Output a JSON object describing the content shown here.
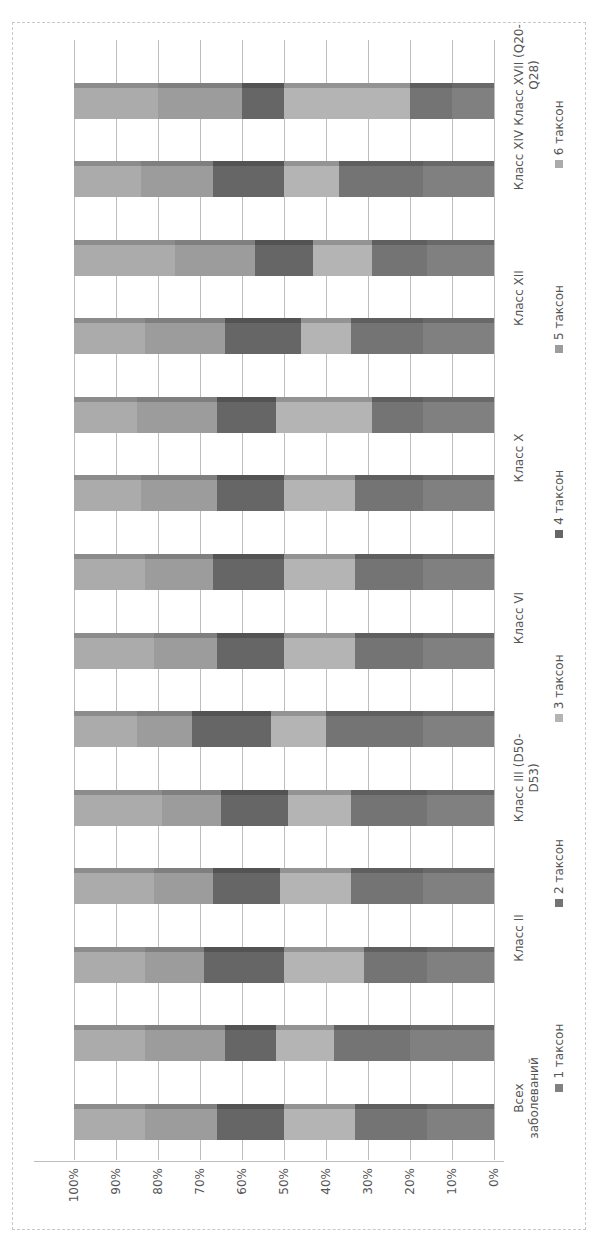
{
  "chart_data": {
    "type": "bar",
    "subtype": "100% stacked 3D column (image rotated 90° counter-clockwise)",
    "title": "",
    "xlabel": "",
    "ylabel": "",
    "ylim": [
      0,
      100
    ],
    "yticks": [
      "0%",
      "10%",
      "20%",
      "30%",
      "40%",
      "50%",
      "60%",
      "70%",
      "80%",
      "90%",
      "100%"
    ],
    "grid": true,
    "legend_position": "bottom",
    "categories": [
      "Всех заболеваний",
      "",
      "Класс II",
      "",
      "Класс III (D50-D53)",
      "",
      "Класс VI",
      "",
      "Класс X",
      "",
      "Класс XII",
      "",
      "Класс XIV",
      "Класс XVII (Q20-Q28)"
    ],
    "series": [
      {
        "name": "1 таксон",
        "color": "#808080",
        "values": [
          16,
          20,
          16,
          17,
          16,
          17,
          17,
          17,
          17,
          17,
          17,
          16,
          17,
          10
        ]
      },
      {
        "name": "2 таксон",
        "color": "#747474",
        "values": [
          17,
          18,
          15,
          17,
          18,
          23,
          16,
          16,
          16,
          12,
          17,
          13,
          20,
          10
        ]
      },
      {
        "name": "3 таксон",
        "color": "#b4b4b4",
        "values": [
          17,
          14,
          19,
          17,
          15,
          13,
          17,
          17,
          17,
          23,
          12,
          14,
          13,
          30
        ]
      },
      {
        "name": "4 таксон",
        "color": "#666666",
        "values": [
          16,
          12,
          19,
          16,
          16,
          19,
          16,
          17,
          16,
          14,
          18,
          14,
          17,
          10
        ]
      },
      {
        "name": "5 таксон",
        "color": "#9c9c9c",
        "values": [
          17,
          19,
          14,
          14,
          14,
          13,
          15,
          16,
          18,
          19,
          19,
          19,
          17,
          20
        ]
      },
      {
        "name": "6 таксон",
        "color": "#ababab",
        "values": [
          17,
          17,
          17,
          19,
          21,
          15,
          19,
          17,
          16,
          15,
          17,
          24,
          16,
          20
        ]
      }
    ]
  },
  "legend": [
    {
      "label": "1 таксон",
      "color": "#808080"
    },
    {
      "label": "2 таксон",
      "color": "#747474"
    },
    {
      "label": "3 таксон",
      "color": "#b4b4b4"
    },
    {
      "label": "4 таксон",
      "color": "#666666"
    },
    {
      "label": "5 таксон",
      "color": "#9c9c9c"
    },
    {
      "label": "6 таксон",
      "color": "#ababab"
    }
  ],
  "axis": {
    "ticks": [
      "0%",
      "10%",
      "20%",
      "30%",
      "40%",
      "50%",
      "60%",
      "70%",
      "80%",
      "90%",
      "100%"
    ]
  },
  "labels": {
    "c0a": "Всех",
    "c0b": "заболеваний",
    "c2": "Класс II",
    "c4a": "Класс III  (D50-",
    "c4b": "D53)",
    "c6": "Класс VI",
    "c8": "Класс X",
    "c10": "Класс XII",
    "c12": "Класс XIV",
    "c13a": "Класс XVII (Q20-",
    "c13b": "Q28)"
  }
}
